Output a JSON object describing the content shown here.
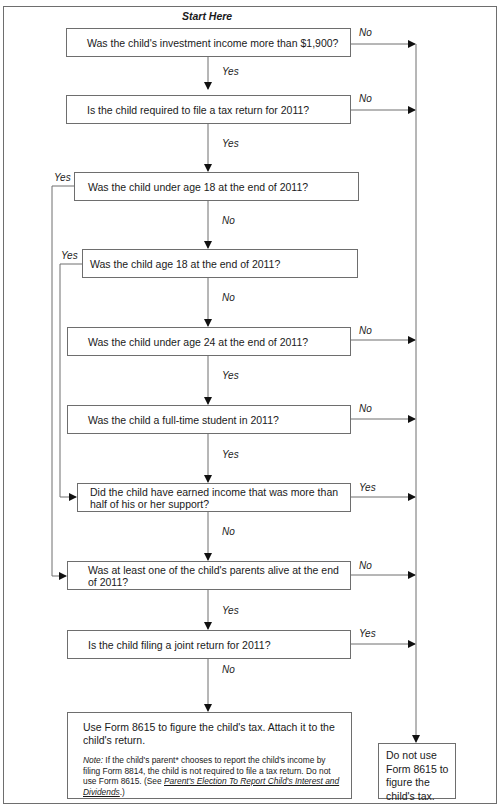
{
  "flowchart": {
    "start_label": "Start Here",
    "questions": [
      {
        "id": "q1",
        "text": "Was the child's investment income more than $1,900?",
        "down_label": "Yes",
        "right_label": "No"
      },
      {
        "id": "q2",
        "text": "Is the child required to file a tax return for 2011?",
        "down_label": "Yes",
        "right_label": "No"
      },
      {
        "id": "q3",
        "text": "Was the child under age 18 at the end of 2011?",
        "down_label": "No",
        "left_label": "Yes"
      },
      {
        "id": "q4",
        "text": "Was the child age 18 at the end of 2011?",
        "down_label": "No",
        "left_label": "Yes"
      },
      {
        "id": "q5",
        "text": "Was the child under age 24 at the end of 2011?",
        "down_label": "Yes",
        "right_label": "No"
      },
      {
        "id": "q6",
        "text": "Was the child a full-time student in 2011?",
        "down_label": "Yes",
        "right_label": "No"
      },
      {
        "id": "q7",
        "text": "Did the child have earned income that was more than half of his or her support?",
        "down_label": "No",
        "right_label": "Yes"
      },
      {
        "id": "q8",
        "text": "Was at least one of the child's parents alive at the end of 2011?",
        "down_label": "Yes",
        "right_label": "No"
      },
      {
        "id": "q9",
        "text": "Is the child filing a joint return for 2011?",
        "down_label": "No",
        "right_label": "Yes"
      }
    ],
    "outcome_use": {
      "text": "Use Form 8615 to figure the child's tax. Attach it to the child's return.",
      "note_label": "Note:",
      "note_text": " If the child's parent* chooses to report the child's income by filing Form 8814, the child is not required to file a tax return. Do not use Form 8615. (See ",
      "note_link": "Parent's Election To Report Child's Interest and Dividends",
      "note_end": ".)"
    },
    "outcome_do_not_use": {
      "text": "Do not use Form 8615 to figure the child's tax."
    }
  },
  "colors": {
    "line": "#6e6e6e",
    "arrow": "#111111",
    "text": "#1a1a1a"
  }
}
